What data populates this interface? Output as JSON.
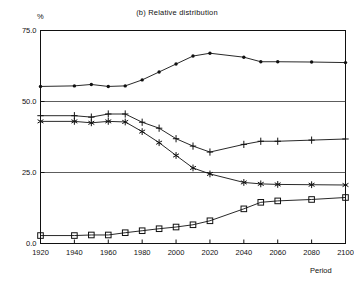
{
  "chart_data": {
    "type": "line",
    "title": "(b) Relative distribution",
    "xlabel": "Period",
    "ylabel": "%",
    "xlim": [
      1920,
      2100
    ],
    "ylim": [
      0.0,
      75.0
    ],
    "grid": true,
    "legend_position": "none",
    "y_ticks": [
      "0.0",
      "25.0",
      "50.0",
      "75.0"
    ],
    "y_tick_values": [
      0.0,
      25.0,
      50.0,
      75.0
    ],
    "x_ticks": [
      "1920",
      "1940",
      "1960",
      "1980",
      "2000",
      "2020",
      "2040",
      "2060",
      "2080",
      "2100"
    ],
    "x_tick_values": [
      1920,
      1940,
      1960,
      1980,
      2000,
      2020,
      2040,
      2060,
      2080,
      2100
    ],
    "x": [
      1920,
      1940,
      1950,
      1960,
      1970,
      1980,
      1990,
      2000,
      2010,
      2020,
      2040,
      2050,
      2060,
      2080,
      2100
    ],
    "series": [
      {
        "name": "working-age-share",
        "marker": "filled-circle",
        "values": [
          55.3,
          55.5,
          56.0,
          55.3,
          55.5,
          57.6,
          60.4,
          63.2,
          66.0,
          67.0,
          65.6,
          64.0,
          64.0,
          63.9,
          63.7
        ]
      },
      {
        "name": "plus-series",
        "marker": "plus",
        "values": [
          45.0,
          45.0,
          44.5,
          45.6,
          45.6,
          42.7,
          40.6,
          36.9,
          34.3,
          32.2,
          34.9,
          36.0,
          36.0,
          36.4,
          36.8
        ]
      },
      {
        "name": "asterisk-series",
        "marker": "asterisk",
        "values": [
          43.0,
          43.0,
          42.5,
          43.0,
          42.8,
          39.4,
          35.5,
          31.0,
          26.6,
          24.5,
          21.5,
          21.0,
          20.8,
          20.7,
          20.6
        ]
      },
      {
        "name": "square-series",
        "marker": "open-square",
        "values": [
          2.8,
          2.8,
          3.0,
          3.0,
          3.8,
          4.5,
          5.2,
          5.8,
          6.6,
          8.0,
          12.2,
          14.5,
          15.0,
          15.5,
          16.2
        ]
      }
    ],
    "colors": {
      "axis": "#111111",
      "grid": "#333333",
      "line": "#111111",
      "background": "#ffffff"
    }
  }
}
